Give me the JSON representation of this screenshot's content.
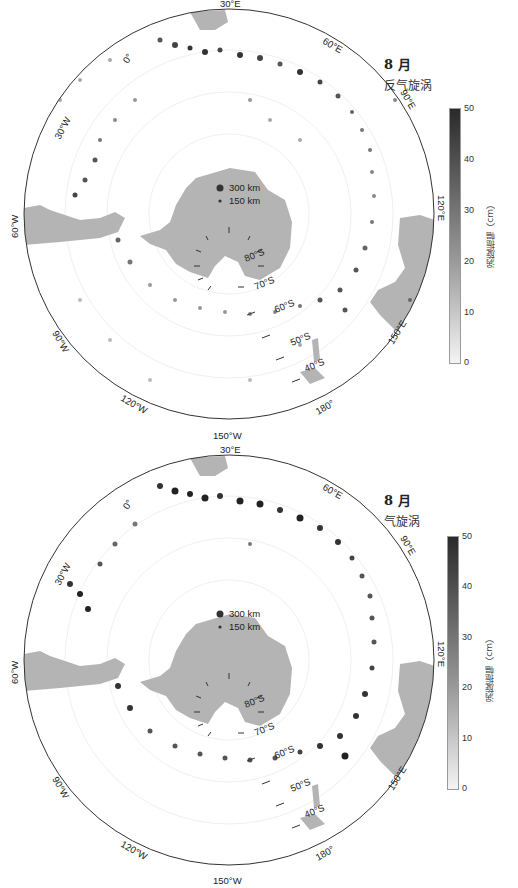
{
  "figure": {
    "panels": [
      {
        "id": "anticyclone",
        "month": "8 月",
        "type_label": "反气旋涡",
        "colorbar": {
          "label": "涡旋振幅（cm）",
          "ticks": [
            "50",
            "40",
            "30",
            "20",
            "10",
            "0"
          ],
          "min": 0,
          "max": 50,
          "color_low": "#f4f4f4",
          "color_high": "#2a2a2a"
        },
        "legend": {
          "large": "300 km",
          "small": "150 km"
        },
        "lat_labels": [
          "80°S",
          "70°S",
          "60°S",
          "50°S",
          "40°S"
        ],
        "lon_labels": [
          "30°E",
          "0°",
          "60°E",
          "30°W",
          "90°E",
          "60°W",
          "120°E",
          "90°W",
          "150°E",
          "120°W",
          "180°",
          "150°W"
        ]
      },
      {
        "id": "cyclone",
        "month": "8 月",
        "type_label": "气旋涡",
        "colorbar": {
          "label": "涡旋振幅（cm）",
          "ticks": [
            "50",
            "40",
            "30",
            "20",
            "10",
            "0"
          ],
          "min": 0,
          "max": 50,
          "color_low": "#f4f4f4",
          "color_high": "#2a2a2a"
        },
        "legend": {
          "large": "300 km",
          "small": "150 km"
        },
        "lat_labels": [
          "80°S",
          "70°S",
          "60°S",
          "50°S",
          "40°S"
        ],
        "lon_labels": [
          "30°E",
          "0°",
          "60°E",
          "30°W",
          "90°E",
          "60°W",
          "120°E",
          "90°W",
          "150°E",
          "120°W",
          "180°",
          "150°W"
        ]
      }
    ],
    "colors": {
      "land": "#b4b4b4",
      "frame": "#333333",
      "grid": "#e6e6e6"
    }
  }
}
